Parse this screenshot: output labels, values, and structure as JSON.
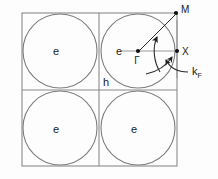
{
  "figure": {
    "type": "brillouin-zone-fermi-surface-diagram",
    "background_color": "#fdfdfd",
    "line_color": "#8a8a8a",
    "annotation_color": "#2b2b2b"
  },
  "labels": {
    "electron_top_left": "e",
    "electron_top_right": "e",
    "electron_bottom_left": "e",
    "electron_bottom_right": "e",
    "hole_region": "h",
    "gamma_point": "Γ",
    "x_point": "X",
    "m_point": "M",
    "fermi_wavevector": "k",
    "fermi_wavevector_subscript": "F"
  },
  "geometry": {
    "cell_left": 22,
    "cell_top": 13,
    "cell_right": 177,
    "cell_bottom": 166,
    "cell_mid_x": 99,
    "cell_mid_y": 90,
    "circle_radius": 37,
    "circle_centers": [
      {
        "cx": 60,
        "cy": 51
      },
      {
        "cx": 138,
        "cy": 51
      },
      {
        "cx": 60,
        "cy": 128
      },
      {
        "cx": 138,
        "cy": 128
      }
    ]
  },
  "points": [
    {
      "name": "Γ",
      "x": 138,
      "y": 51
    },
    {
      "name": "X",
      "x": 177,
      "y": 51
    },
    {
      "name": "M",
      "x": 177,
      "y": 13
    }
  ]
}
